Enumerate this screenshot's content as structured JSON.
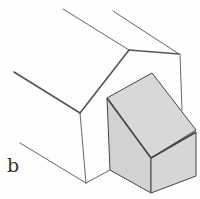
{
  "figure": {
    "label": "b",
    "colors": {
      "line": "#555555",
      "shade": "#d4d4d4",
      "background": "#fdfdfd"
    }
  }
}
